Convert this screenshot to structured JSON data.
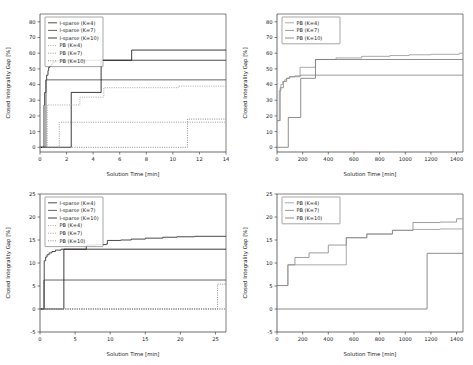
{
  "figure": {
    "background": "#ffffff",
    "panel_count": 4
  },
  "axis_titles": {
    "x_min": "Solution Time [min]",
    "y": "Closed Integrality Gap [%]"
  },
  "series_colors": {
    "lsparse_k4": "#2b2b2b",
    "lsparse_k7": "#4a4a4a",
    "lsparse_k10": "#1a1a1a",
    "pb_k4": "#9a9a9a",
    "pb_k7": "#8a8a8a",
    "pb_k10": "#7a7a7a"
  },
  "chart_data": [
    {
      "id": "top-left",
      "type": "line",
      "title": "",
      "xlabel": "Solution Time [min]",
      "ylabel": "Closed Integrality Gap [%]",
      "xlim": [
        0,
        14
      ],
      "ylim": [
        -3,
        85
      ],
      "xticks": [
        0,
        2,
        4,
        6,
        8,
        10,
        12,
        14
      ],
      "yticks": [
        0,
        10,
        20,
        30,
        40,
        50,
        60,
        70,
        80
      ],
      "grid": false,
      "legend_position": "upper left",
      "drawstyle": "steps-post",
      "series": [
        {
          "name": "l-sparse (K=4)",
          "color": "#2b2b2b",
          "dash": "solid",
          "x": [
            0.0,
            0.3,
            0.35,
            0.45,
            0.5,
            0.6,
            0.65,
            0.75,
            0.85,
            0.95,
            1.05,
            1.2,
            1.35,
            1.5,
            14.0
          ],
          "y": [
            0,
            27,
            35,
            43,
            46,
            49,
            51,
            52,
            53,
            54,
            54.5,
            55,
            55.2,
            55.5,
            55.5
          ]
        },
        {
          "name": "l-sparse (K=7)",
          "color": "#4a4a4a",
          "dash": "solid",
          "x": [
            0.0,
            0.45,
            14.0
          ],
          "y": [
            0,
            43,
            43
          ]
        },
        {
          "name": "l-sparse (K=10)",
          "color": "#1a1a1a",
          "dash": "solid",
          "x": [
            0.0,
            2.35,
            4.6,
            6.9,
            14.0
          ],
          "y": [
            0,
            35,
            55.5,
            62,
            62
          ]
        },
        {
          "name": "PB (K=4)",
          "color": "#9a9a9a",
          "dash": "dotted",
          "x": [
            0.0,
            0.55,
            1.5,
            3.0,
            4.8,
            10.4,
            14.0
          ],
          "y": [
            0,
            27,
            27,
            32,
            38,
            39,
            39
          ]
        },
        {
          "name": "PB (K=7)",
          "color": "#8a8a8a",
          "dash": "dotted",
          "x": [
            0.0,
            1.45,
            3.05,
            14.0
          ],
          "y": [
            0,
            16,
            16,
            16
          ]
        },
        {
          "name": "PB (K=10)",
          "color": "#7a7a7a",
          "dash": "dotted",
          "x": [
            0.0,
            11.1,
            14.0
          ],
          "y": [
            0,
            18,
            18
          ]
        }
      ]
    },
    {
      "id": "top-right",
      "type": "line",
      "title": "",
      "xlabel": "Solution Time [min]",
      "ylabel": "Closed Integrality Gap [%]",
      "xlim": [
        0,
        1450
      ],
      "ylim": [
        -3,
        85
      ],
      "xticks": [
        0,
        200,
        400,
        600,
        800,
        1000,
        1200,
        1400
      ],
      "yticks": [
        0,
        10,
        20,
        30,
        40,
        50,
        60,
        70,
        80
      ],
      "grid": false,
      "legend_position": "upper left",
      "drawstyle": "steps-post",
      "series": [
        {
          "name": "PB (K=4)",
          "color": "#9a9a9a",
          "dash": "solid",
          "x": [
            0,
            18,
            30,
            45,
            60,
            75,
            95,
            180,
            300,
            460,
            660,
            880,
            1030,
            1200,
            1420,
            1450
          ],
          "y": [
            17,
            36,
            40,
            42,
            43,
            44,
            45,
            51,
            56,
            57,
            58,
            58.5,
            59,
            59.3,
            60,
            60
          ]
        },
        {
          "name": "PB (K=7)",
          "color": "#8a8a8a",
          "dash": "solid",
          "x": [
            0,
            25,
            50,
            75,
            100,
            140,
            185,
            300,
            1450
          ],
          "y": [
            17,
            38,
            42,
            44,
            45,
            45.5,
            46,
            46,
            46
          ]
        },
        {
          "name": "PB (K=10)",
          "color": "#7a7a7a",
          "dash": "solid",
          "x": [
            0,
            88,
            185,
            300,
            1450
          ],
          "y": [
            0,
            19,
            44,
            56,
            56
          ]
        }
      ]
    },
    {
      "id": "bottom-left",
      "type": "line",
      "title": "",
      "xlabel": "Solution Time [min]",
      "ylabel": "Closed Integrality Gap [%]",
      "xlim": [
        0,
        26.5
      ],
      "ylim": [
        -5,
        25
      ],
      "xticks": [
        0,
        5,
        10,
        15,
        20,
        25
      ],
      "yticks": [
        -5,
        0,
        5,
        10,
        15,
        20,
        25
      ],
      "grid": false,
      "legend_position": "upper left",
      "drawstyle": "steps-post",
      "series": [
        {
          "name": "l-sparse (K=4)",
          "color": "#2b2b2b",
          "dash": "solid",
          "x": [
            0.0,
            0.6,
            0.8,
            1.0,
            1.3,
            1.7,
            2.2,
            3.0,
            4.0,
            6.4,
            6.6,
            8.0,
            9.4,
            9.6,
            11.5,
            13.0,
            15.0,
            17.5,
            19.5,
            22.0,
            26.5
          ],
          "y": [
            0,
            10.5,
            11.3,
            11.8,
            12.2,
            12.5,
            12.8,
            13.0,
            13.0,
            13.0,
            13.9,
            14.0,
            14.1,
            14.9,
            15.0,
            15.2,
            15.4,
            15.6,
            15.7,
            15.8,
            15.8
          ]
        },
        {
          "name": "l-sparse (K=7)",
          "color": "#4a4a4a",
          "dash": "solid",
          "x": [
            0.0,
            0.55,
            26.5
          ],
          "y": [
            0,
            6.3,
            6.3
          ]
        },
        {
          "name": "l-sparse (K=10)",
          "color": "#1a1a1a",
          "dash": "solid",
          "x": [
            0.0,
            3.4,
            26.5
          ],
          "y": [
            0,
            13.0,
            13.0
          ]
        },
        {
          "name": "PB (K=4)",
          "color": "#9a9a9a",
          "dash": "dotted",
          "x": [
            0.0,
            26.5
          ],
          "y": [
            0,
            0
          ]
        },
        {
          "name": "PB (K=7)",
          "color": "#8a8a8a",
          "dash": "dotted",
          "x": [
            0.0,
            26.5
          ],
          "y": [
            0,
            0
          ]
        },
        {
          "name": "PB (K=10)",
          "color": "#7a7a7a",
          "dash": "dotted",
          "x": [
            0.0,
            25.3,
            26.5
          ],
          "y": [
            0,
            5.4,
            5.4
          ]
        }
      ]
    },
    {
      "id": "bottom-right",
      "type": "line",
      "title": "",
      "xlabel": "Solution Time [min]",
      "ylabel": "Closed Integrality Gap [%]",
      "xlim": [
        0,
        1450
      ],
      "ylim": [
        -5,
        25
      ],
      "xticks": [
        0,
        200,
        400,
        600,
        800,
        1000,
        1200,
        1400
      ],
      "yticks": [
        -5,
        0,
        5,
        10,
        15,
        20,
        25
      ],
      "grid": false,
      "legend_position": "upper left",
      "drawstyle": "steps-post",
      "series": [
        {
          "name": "PB (K=4)",
          "color": "#9a9a9a",
          "dash": "solid",
          "x": [
            0,
            30,
            85,
            140,
            200,
            320,
            400,
            540,
            700,
            900,
            1060,
            1270,
            1400,
            1450
          ],
          "y": [
            5.1,
            5.1,
            9.6,
            9.6,
            9.6,
            9.6,
            9.6,
            15.5,
            16.3,
            17.1,
            17.3,
            17.4,
            17.4,
            17.4
          ]
        },
        {
          "name": "PB (K=7)",
          "color": "#8a8a8a",
          "dash": "solid",
          "x": [
            0,
            30,
            85,
            140,
            200,
            250,
            320,
            400,
            540,
            700,
            900,
            1060,
            1270,
            1400,
            1450
          ],
          "y": [
            5.1,
            5.1,
            9.6,
            11.2,
            11.2,
            12.2,
            12.2,
            13.9,
            15.5,
            16.3,
            17.1,
            18.8,
            18.9,
            19.6,
            19.6
          ]
        },
        {
          "name": "PB (K=10)",
          "color": "#7a7a7a",
          "dash": "solid",
          "x": [
            0,
            140,
            1170,
            1450
          ],
          "y": [
            0,
            0,
            12.1,
            12.1
          ]
        }
      ]
    }
  ],
  "panels": [
    {
      "id": "top-left",
      "legend": [
        {
          "label": "l-sparse (K=4)",
          "color": "#2b2b2b",
          "dash": "solid"
        },
        {
          "label": "l-sparse (K=7)",
          "color": "#4a4a4a",
          "dash": "solid"
        },
        {
          "label": "l-sparse (K=10)",
          "color": "#1a1a1a",
          "dash": "solid"
        },
        {
          "label": "PB (K=4)",
          "color": "#9a9a9a",
          "dash": "dotted"
        },
        {
          "label": "PB (K=7)",
          "color": "#8a8a8a",
          "dash": "dotted"
        },
        {
          "label": "PB (K=10)",
          "color": "#7a7a7a",
          "dash": "dotted"
        }
      ]
    },
    {
      "id": "top-right",
      "legend": [
        {
          "label": "PB (K=4)",
          "color": "#9a9a9a",
          "dash": "solid"
        },
        {
          "label": "PB (K=7)",
          "color": "#8a8a8a",
          "dash": "solid"
        },
        {
          "label": "PB (K=10)",
          "color": "#7a7a7a",
          "dash": "solid"
        }
      ]
    },
    {
      "id": "bottom-left",
      "legend": [
        {
          "label": "l-sparse (K=4)",
          "color": "#2b2b2b",
          "dash": "solid"
        },
        {
          "label": "l-sparse (K=7)",
          "color": "#4a4a4a",
          "dash": "solid"
        },
        {
          "label": "l-sparse (K=10)",
          "color": "#1a1a1a",
          "dash": "solid"
        },
        {
          "label": "PB (K=4)",
          "color": "#9a9a9a",
          "dash": "dotted"
        },
        {
          "label": "PB (K=7)",
          "color": "#8a8a8a",
          "dash": "dotted"
        },
        {
          "label": "PB (K=10)",
          "color": "#7a7a7a",
          "dash": "dotted"
        }
      ]
    },
    {
      "id": "bottom-right",
      "legend": [
        {
          "label": "PB (K=4)",
          "color": "#9a9a9a",
          "dash": "solid"
        },
        {
          "label": "PB (K=7)",
          "color": "#8a8a8a",
          "dash": "solid"
        },
        {
          "label": "PB (K=10)",
          "color": "#7a7a7a",
          "dash": "solid"
        }
      ]
    }
  ]
}
